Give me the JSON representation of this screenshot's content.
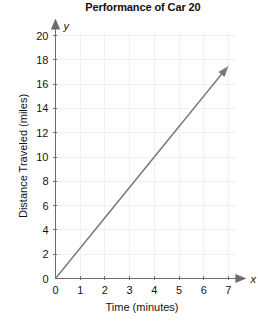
{
  "chart_data": {
    "type": "line",
    "title": "Performance of Car 20",
    "xlabel": "Time (minutes)",
    "ylabel": "Distance Traveled (miles)",
    "x_axis_letter": "x",
    "y_axis_letter": "y",
    "xlim": [
      0,
      7
    ],
    "ylim": [
      0,
      20
    ],
    "xticks": [
      0,
      1,
      2,
      3,
      4,
      5,
      6,
      7
    ],
    "yticks": [
      0,
      2,
      4,
      6,
      8,
      10,
      12,
      14,
      16,
      18,
      20
    ],
    "xtick_labels": [
      "0",
      "1",
      "2",
      "3",
      "4",
      "5",
      "6",
      "7"
    ],
    "ytick_labels": [
      "0",
      "2",
      "4",
      "6",
      "8",
      "10",
      "12",
      "14",
      "16",
      "18",
      "20"
    ],
    "grid": true,
    "legend": "none",
    "series": [
      {
        "name": "Car 20 distance",
        "kind": "ray",
        "slope": 2.5,
        "intercept": 0,
        "arrow_end": true,
        "points": [
          {
            "x": 0,
            "y": 0
          },
          {
            "x": 7,
            "y": 17.5
          }
        ]
      }
    ],
    "colors": {
      "axis": "#6d6d6d",
      "grid": "#f1f1f1",
      "series": "#7a7a7a",
      "text": "#141414",
      "background": "#ffffff"
    }
  }
}
